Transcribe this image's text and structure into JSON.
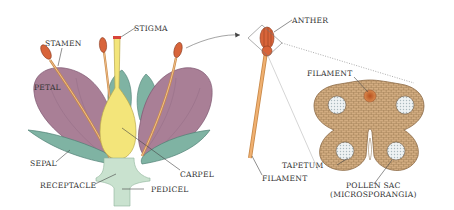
{
  "colors": {
    "petal": "#a97f96",
    "petal_dark": "#7d5670",
    "sepal": "#7fb3a3",
    "sepal_dark": "#4f7f74",
    "carpel": "#f3e57a",
    "carpel_edge": "#b9a84a",
    "receptacle": "#c9e2cf",
    "stamen_filament": "#e0a060",
    "anther": "#d8643a",
    "anther_dark": "#8a3a1e",
    "stigma": "#d8443a",
    "tissue": "#d9b387",
    "tissue_line": "#8b6a45",
    "pollen": "#e9eef0",
    "text": "#333333",
    "leader": "#444444"
  },
  "flower_labels": {
    "stigma": "STIGMA",
    "stamen": "STAMEN",
    "petal": "PETAL",
    "sepal": "SEPAL",
    "receptacle": "RECEPTACLE",
    "pedicel": "PEDICEL",
    "carpel": "CARPEL"
  },
  "stamen_labels": {
    "anther": "ANTHER",
    "filament": "FILAMENT"
  },
  "cross_section_labels": {
    "filament": "FILAMENT",
    "tapetum": "TAPETUM",
    "pollen_sac_line1": "POLLEN SAC",
    "pollen_sac_line2": "(MICROSPORANGIA)"
  }
}
